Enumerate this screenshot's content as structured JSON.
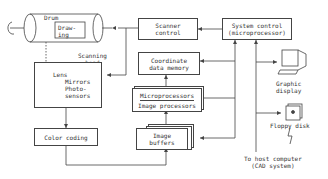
{
  "diagram": {
    "drum": {
      "label": "Drum",
      "drawing_label": "Draw-\ning"
    },
    "scanning_head": "Scanning\nhead",
    "sensor_block": {
      "lens": "Lens",
      "mirrors": "Mirrors",
      "photosensors": "Photo-\nsensors"
    },
    "color_coding": "Color coding",
    "scanner_control": "Scanner\ncontrol",
    "coordinate_memory": "Coordinate\ndata memory",
    "processors": {
      "top": "Microprocessors",
      "bottom": "Image processors"
    },
    "image_buffers": "Image\nbuffers",
    "system_control": "System control\n(microprocessor)",
    "graphic_display": "Graphic\ndisplay",
    "floppy_disk": "Floppy disk",
    "host_computer": "To host computer\n(CAD system)"
  }
}
